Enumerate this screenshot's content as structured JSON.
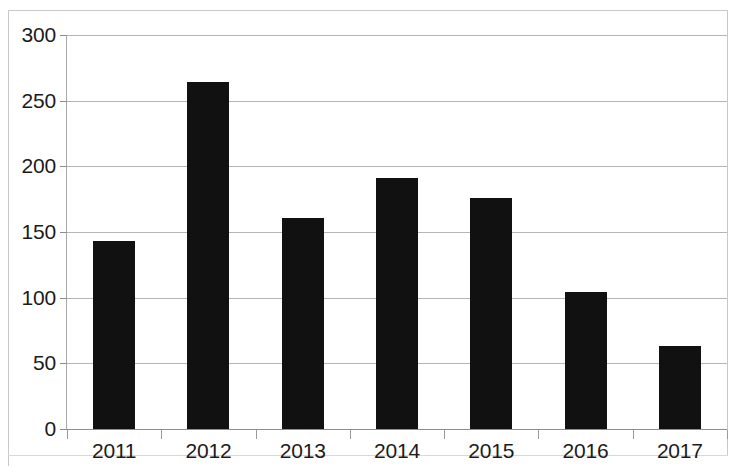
{
  "chart_data": {
    "type": "bar",
    "title": "",
    "subtitle": "",
    "xlabel": "",
    "ylabel": "",
    "categories": [
      "2011",
      "2012",
      "2013",
      "2014",
      "2015",
      "2016",
      "2017"
    ],
    "values": [
      143,
      264,
      161,
      191,
      176,
      104,
      63
    ],
    "series": [
      {
        "name": "",
        "values": [
          143,
          264,
          161,
          191,
          176,
          104,
          63
        ]
      }
    ],
    "ylim": [
      0,
      300
    ],
    "y_ticks": [
      0,
      50,
      100,
      150,
      200,
      250,
      300
    ],
    "y_tick_labels": [
      "0",
      "50",
      "100",
      "150",
      "200",
      "250",
      "300"
    ],
    "grid": true,
    "grid_axis": "y",
    "legend": false,
    "legend_position": "none",
    "bar_color": "#111111",
    "grid_color": "#b5b5b5",
    "axis_color": "#8d8d8d",
    "text_color": "#1b1b1b",
    "annotations": []
  }
}
